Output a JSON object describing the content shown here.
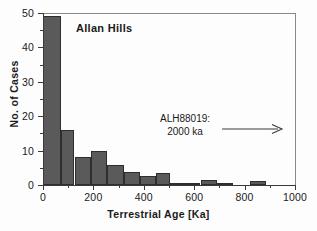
{
  "chart_data": {
    "type": "bar",
    "title": "Allan Hills",
    "xlabel": "Terrestrial Age [Ka]",
    "ylabel": "No. of Cases",
    "xlim": [
      0,
      1000
    ],
    "ylim": [
      0,
      50
    ],
    "grid": false,
    "legend": "none",
    "bin_width": 50,
    "xticks": [
      0,
      200,
      400,
      600,
      800,
      1000
    ],
    "xtick_labels": [
      "0",
      "200",
      "400",
      "600",
      "800",
      "1000"
    ],
    "xminor_ticks": [
      100,
      300,
      500,
      700,
      900
    ],
    "yticks": [
      0,
      10,
      20,
      30,
      40,
      50
    ],
    "ytick_labels": [
      "0",
      "10",
      "20",
      "30",
      "40",
      "50"
    ],
    "yminor_ticks": [
      5,
      15,
      25,
      35,
      45
    ],
    "bin_starts": [
      0,
      50,
      100,
      150,
      200,
      250,
      300,
      350,
      400,
      450,
      500,
      550,
      600,
      650,
      700,
      750,
      800,
      850
    ],
    "categories": [
      "0-50",
      "50-100",
      "100-150",
      "150-200",
      "200-250",
      "250-300",
      "300-350",
      "350-400",
      "400-450",
      "450-500",
      "500-550",
      "550-600",
      "600-650",
      "650-700",
      "700-750",
      "750-800",
      "800-850",
      "850-900"
    ],
    "values": [
      49,
      49,
      16,
      8,
      10,
      10,
      5.7,
      3.8,
      2.5,
      3.5,
      0.5,
      0.5,
      0.5,
      1.5,
      0.5,
      0,
      0,
      1.3
    ],
    "bars": [
      {
        "x0": 0,
        "x1": 70,
        "height": 49
      },
      {
        "x0": 70,
        "x1": 125,
        "height": 16
      },
      {
        "x0": 125,
        "x1": 190,
        "height": 8
      },
      {
        "x0": 190,
        "x1": 255,
        "height": 10
      },
      {
        "x0": 255,
        "x1": 320,
        "height": 5.7
      },
      {
        "x0": 320,
        "x1": 385,
        "height": 3.8
      },
      {
        "x0": 385,
        "x1": 450,
        "height": 2.5
      },
      {
        "x0": 450,
        "x1": 505,
        "height": 3.5
      },
      {
        "x0": 505,
        "x1": 625,
        "height": 0.5
      },
      {
        "x0": 625,
        "x1": 690,
        "height": 1.5
      },
      {
        "x0": 690,
        "x1": 755,
        "height": 0.5
      },
      {
        "x0": 820,
        "x1": 885,
        "height": 1.3
      }
    ],
    "annotations": [
      {
        "text_line1": "ALH88019:",
        "text_line2": "2000 ka",
        "arrow": "right-arrow",
        "x": 600,
        "y": 20
      }
    ],
    "bar_color": "#5a5a5a",
    "bar_edge_color": "#2e2e2e",
    "axis_color": "#3a3a3a",
    "background_color": "#fdfdfd"
  },
  "annotation": {
    "line1": "ALH88019:",
    "line2": "2000 ka"
  }
}
